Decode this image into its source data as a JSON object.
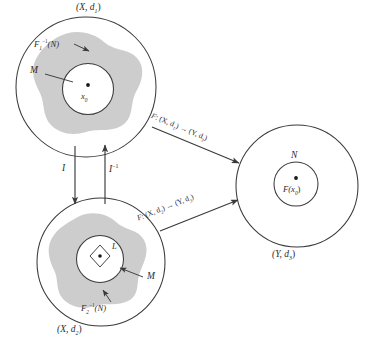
{
  "figure": {
    "background_color": "#ffffff",
    "stroke_color": "#3a3a3a",
    "region_fill": "#c9c9c9",
    "text_color": "#2b2b2b"
  },
  "spaces": {
    "top_left": {
      "label": "(X, d",
      "label_sub": "1",
      "label_close": ")",
      "region_label": "F",
      "region_label_sub": "1",
      "region_label_sup": "−1",
      "region_label_tail": "(N)",
      "neighborhood_label": "M",
      "point_label": "x",
      "point_label_sub": "0"
    },
    "bottom_left": {
      "label": "(X, d",
      "label_sub": "2",
      "label_close": ")",
      "region_label": "F",
      "region_label_sub": "2",
      "region_label_sup": "−1",
      "region_label_tail": "(N)",
      "neighborhood_label": "M",
      "inner_label": "L"
    },
    "right": {
      "label": "(Y, d",
      "label_sub": "3",
      "label_close": ")",
      "neighborhood_label": "N",
      "point_label": "F(x",
      "point_label_sub": "0",
      "point_label_close": ")"
    }
  },
  "maps": {
    "identity_down": "I",
    "identity_up": "I",
    "identity_up_sup": "−1",
    "top_map": {
      "name": "F",
      "colon": ": (X, d",
      "dom_sub": "1",
      "mid": ") → (Y, d",
      "cod_sub": "3",
      "close": ")"
    },
    "bottom_map": {
      "name": "F",
      "colon": ": (X, d",
      "dom_sub": "2",
      "mid": ") → (Y, d",
      "cod_sub": "3",
      "close": ")"
    }
  }
}
